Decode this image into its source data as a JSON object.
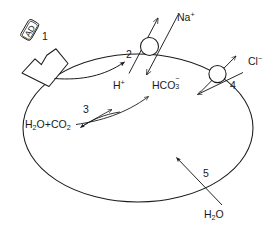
{
  "diagram": {
    "type": "biology-cell-schematic",
    "canvas": {
      "width": 276,
      "height": 230
    },
    "colors": {
      "background": "#ffffff",
      "stroke": "#1a1a1a",
      "text": "#1a1a1a"
    }
  },
  "labels": {
    "ligand": "AD",
    "marker_1": "1",
    "marker_2": "2",
    "marker_3": "3",
    "marker_4": "4",
    "marker_5": "5",
    "sodium": {
      "base": "Na",
      "sup": "+"
    },
    "proton": {
      "base": "H",
      "sup": "+"
    },
    "bicarbonate": {
      "base": "HCO",
      "sub": "3",
      "sup": "−"
    },
    "chloride": {
      "base": "Cl",
      "sup": "−"
    },
    "water_co2": {
      "part1": "H",
      "sub1": "2",
      "part2": "O+CO",
      "sub2": "2"
    },
    "water": {
      "base": "H",
      "sub": "2",
      "tail": "O"
    }
  },
  "structures": {
    "cell_membrane": "ellipse",
    "receptor": "notched-polygon",
    "transporter_2": "circle",
    "transporter_4": "circle"
  },
  "annotations": {
    "item1": "Ligand AD binding to membrane receptor",
    "item2": "Sodium-proton antiporter",
    "item3": "Carbonic anhydrase reversible reaction",
    "item4": "Chloride-bicarbonate antiporter",
    "item5": "Water entry into cell"
  }
}
